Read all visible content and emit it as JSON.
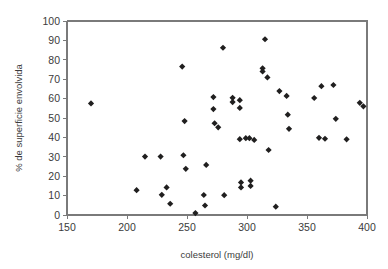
{
  "chart_data": {
    "type": "scatter",
    "title": "",
    "xlabel": "colesterol (mg/dl)",
    "ylabel": "% de superficie envolvida",
    "xlim": [
      150,
      400
    ],
    "ylim": [
      0,
      100
    ],
    "xticks": [
      150,
      200,
      250,
      300,
      350,
      400
    ],
    "yticks": [
      0,
      10,
      20,
      30,
      40,
      50,
      60,
      70,
      80,
      90,
      100
    ],
    "grid": false,
    "legend": null,
    "marker": "diamond",
    "marker_color": "#201f1f",
    "axis_color": "#7a7a7a",
    "points": [
      {
        "x": 170,
        "y": 57.5
      },
      {
        "x": 208,
        "y": 12.8
      },
      {
        "x": 215,
        "y": 30.1
      },
      {
        "x": 228,
        "y": 30.1
      },
      {
        "x": 229,
        "y": 10.4
      },
      {
        "x": 233,
        "y": 14.2
      },
      {
        "x": 236,
        "y": 5.8
      },
      {
        "x": 246,
        "y": 76.5
      },
      {
        "x": 247,
        "y": 30.8
      },
      {
        "x": 248,
        "y": 48.4
      },
      {
        "x": 249,
        "y": 23.8
      },
      {
        "x": 257,
        "y": 1.0
      },
      {
        "x": 264,
        "y": 10.3
      },
      {
        "x": 265,
        "y": 4.9
      },
      {
        "x": 266,
        "y": 25.8
      },
      {
        "x": 272,
        "y": 60.8
      },
      {
        "x": 272,
        "y": 54.6
      },
      {
        "x": 273,
        "y": 47.3
      },
      {
        "x": 276,
        "y": 45.2
      },
      {
        "x": 280,
        "y": 86.2
      },
      {
        "x": 281,
        "y": 10.2
      },
      {
        "x": 288,
        "y": 60.4
      },
      {
        "x": 288,
        "y": 58.2
      },
      {
        "x": 294,
        "y": 59.2
      },
      {
        "x": 294,
        "y": 55.2
      },
      {
        "x": 294,
        "y": 39.1
      },
      {
        "x": 295,
        "y": 16.8
      },
      {
        "x": 295,
        "y": 14.2
      },
      {
        "x": 299,
        "y": 39.6
      },
      {
        "x": 302,
        "y": 39.6
      },
      {
        "x": 303,
        "y": 17.7
      },
      {
        "x": 303,
        "y": 15.0
      },
      {
        "x": 306,
        "y": 38.7
      },
      {
        "x": 313,
        "y": 75.6
      },
      {
        "x": 313,
        "y": 74.0
      },
      {
        "x": 315,
        "y": 90.6
      },
      {
        "x": 317,
        "y": 70.9
      },
      {
        "x": 318,
        "y": 33.5
      },
      {
        "x": 324,
        "y": 4.3
      },
      {
        "x": 327,
        "y": 63.9
      },
      {
        "x": 333,
        "y": 61.4
      },
      {
        "x": 334,
        "y": 51.7
      },
      {
        "x": 335,
        "y": 44.4
      },
      {
        "x": 356,
        "y": 60.3
      },
      {
        "x": 360,
        "y": 39.8
      },
      {
        "x": 362,
        "y": 66.4
      },
      {
        "x": 365,
        "y": 39.3
      },
      {
        "x": 372,
        "y": 67.0
      },
      {
        "x": 374,
        "y": 49.6
      },
      {
        "x": 383,
        "y": 39.0
      },
      {
        "x": 394,
        "y": 57.8
      },
      {
        "x": 397,
        "y": 56.0
      }
    ]
  }
}
